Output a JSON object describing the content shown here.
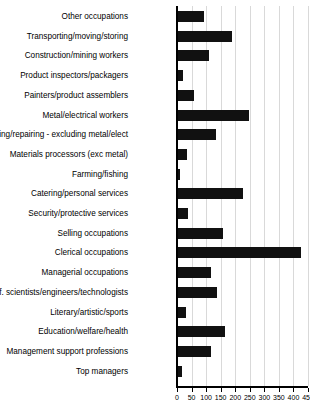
{
  "chart_data": {
    "type": "bar",
    "orientation": "horizontal",
    "title": "",
    "subtitle": "",
    "xlabel": "",
    "ylabel": "",
    "xlim": [
      0,
      450
    ],
    "ylim": null,
    "grid": true,
    "grid_axis": "x",
    "legend": false,
    "legend_position": "none",
    "bar_color": "#111111",
    "grid_color": "#d9d9d9",
    "axis_color": "#000000",
    "background_color": "#ffffff",
    "xticks": [
      0,
      50,
      100,
      150,
      200,
      250,
      300,
      350,
      400,
      450
    ],
    "xticklabels": [
      "0",
      "50",
      "100",
      "150",
      "200",
      "250",
      "300",
      "350",
      "400",
      "450"
    ],
    "categories": [
      "Other occupations",
      "Transporting/moving/storing",
      "Construction/mining workers",
      "Product inspectors/packagers",
      "Painters/product assemblers",
      "Metal/electrical workers",
      "Making/repairing - excluding metal/elect",
      "Materials processors (exc metal)",
      "Farming/fishing",
      "Catering/personal services",
      "Security/protective services",
      "Selling occupations",
      "Clerical occupations",
      "Managerial occupations",
      "Prof. scientists/engineers/technologists",
      "Literary/artistic/sports",
      "Education/welfare/health",
      "Management support professions",
      "Top managers"
    ],
    "values": [
      93,
      189,
      110,
      21,
      58,
      247,
      135,
      34,
      10,
      227,
      38,
      158,
      425,
      118,
      137,
      31,
      165,
      118,
      16
    ]
  }
}
